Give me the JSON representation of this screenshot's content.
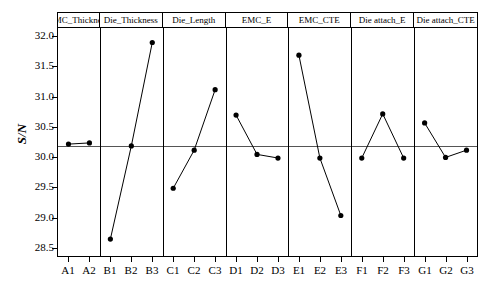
{
  "chart_data": {
    "type": "line",
    "title": "",
    "xlabel": "",
    "ylabel": "S/N",
    "ylim": [
      28.35,
      32.12
    ],
    "yticks": [
      32.0,
      31.5,
      31.0,
      30.5,
      30.0,
      29.5,
      29.0,
      28.5
    ],
    "ytick_labels": [
      "32.0",
      "31.5",
      "31.0",
      "30.5",
      "30.0",
      "29.5",
      "29.0",
      "28.5"
    ],
    "grid": false,
    "reference_line": 30.17,
    "legend": "none",
    "panels": [
      {
        "label": "EMC_Thickness",
        "categories": [
          "A1",
          "A2"
        ],
        "values": [
          30.2,
          30.22
        ]
      },
      {
        "label": "Die_Thickness",
        "categories": [
          "B1",
          "B2",
          "B3"
        ],
        "values": [
          28.63,
          30.17,
          31.88
        ]
      },
      {
        "label": "Die_Length",
        "categories": [
          "C1",
          "C2",
          "C3"
        ],
        "values": [
          29.47,
          30.1,
          31.1
        ]
      },
      {
        "label": "EMC_E",
        "categories": [
          "D1",
          "D2",
          "D3"
        ],
        "values": [
          30.68,
          30.03,
          29.97
        ]
      },
      {
        "label": "EMC_CTE",
        "categories": [
          "E1",
          "E2",
          "E3"
        ],
        "values": [
          31.67,
          29.97,
          29.02
        ]
      },
      {
        "label": "Die attach_E",
        "categories": [
          "F1",
          "F2",
          "F3"
        ],
        "values": [
          29.97,
          30.7,
          29.97
        ]
      },
      {
        "label": "Die attach_CTE",
        "categories": [
          "G1",
          "G2",
          "G3"
        ],
        "values": [
          30.55,
          29.98,
          30.1
        ]
      }
    ],
    "colors": {
      "line": "#000000",
      "marker": "#000000",
      "axis": "#000000",
      "reference_line": "#555555",
      "background": "#ffffff"
    }
  }
}
